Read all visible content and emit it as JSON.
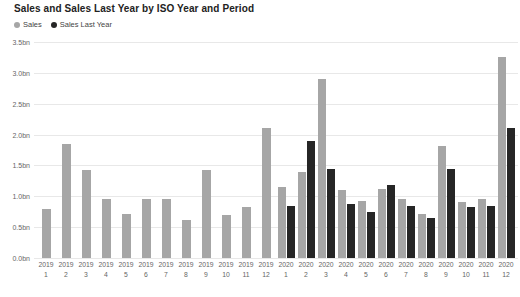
{
  "chart_data": {
    "type": "bar",
    "title": "Sales and Sales Last Year by ISO Year and Period",
    "xlabel": "",
    "ylabel": "",
    "ylim": [
      0,
      3.5
    ],
    "grid": true,
    "legend_position": "top-left",
    "y_ticks": [
      "0.0bn",
      "0.5bn",
      "1.0bn",
      "1.5bn",
      "2.0bn",
      "2.5bn",
      "3.0bn",
      "3.5bn"
    ],
    "y_tick_values": [
      0,
      0.5,
      1.0,
      1.5,
      2.0,
      2.5,
      3.0,
      3.5
    ],
    "categories": [
      "2019 1",
      "2019 2",
      "2019 3",
      "2019 4",
      "2019 5",
      "2019 6",
      "2019 7",
      "2019 8",
      "2019 9",
      "2019 10",
      "2019 11",
      "2019 12",
      "2020 1",
      "2020 2",
      "2020 3",
      "2020 4",
      "2020 5",
      "2020 6",
      "2020 7",
      "2020 8",
      "2020 9",
      "2020 10",
      "2020 11",
      "2020 12"
    ],
    "category_years": [
      "2019",
      "2019",
      "2019",
      "2019",
      "2019",
      "2019",
      "2019",
      "2019",
      "2019",
      "2019",
      "2019",
      "2019",
      "2020",
      "2020",
      "2020",
      "2020",
      "2020",
      "2020",
      "2020",
      "2020",
      "2020",
      "2020",
      "2020",
      "2020"
    ],
    "category_periods": [
      "1",
      "2",
      "3",
      "4",
      "5",
      "6",
      "7",
      "8",
      "9",
      "10",
      "11",
      "12",
      "1",
      "2",
      "3",
      "4",
      "5",
      "6",
      "7",
      "8",
      "9",
      "10",
      "11",
      "12"
    ],
    "series": [
      {
        "name": "Sales",
        "color": "#a6a6a6",
        "values": [
          0.8,
          1.85,
          1.42,
          0.95,
          0.72,
          0.95,
          0.95,
          0.62,
          1.43,
          0.7,
          0.82,
          2.1,
          1.15,
          1.4,
          2.9,
          1.1,
          0.92,
          1.12,
          0.95,
          0.72,
          1.82,
          0.9,
          0.95,
          3.25
        ]
      },
      {
        "name": "Sales Last Year",
        "color": "#262626",
        "values": [
          null,
          null,
          null,
          null,
          null,
          null,
          null,
          null,
          null,
          null,
          null,
          null,
          0.85,
          1.9,
          1.45,
          0.88,
          0.75,
          1.18,
          0.85,
          0.65,
          1.45,
          0.82,
          0.85,
          2.1
        ]
      }
    ]
  },
  "legend": {
    "items": [
      {
        "label": "Sales",
        "color": "#a6a6a6"
      },
      {
        "label": "Sales Last Year",
        "color": "#262626"
      }
    ]
  },
  "colors": {
    "sales": "#a6a6a6",
    "sales_last_year": "#262626",
    "gridline": "#e8e8e8",
    "axis_text": "#666666",
    "title_text": "#222222",
    "background": "#ffffff"
  }
}
